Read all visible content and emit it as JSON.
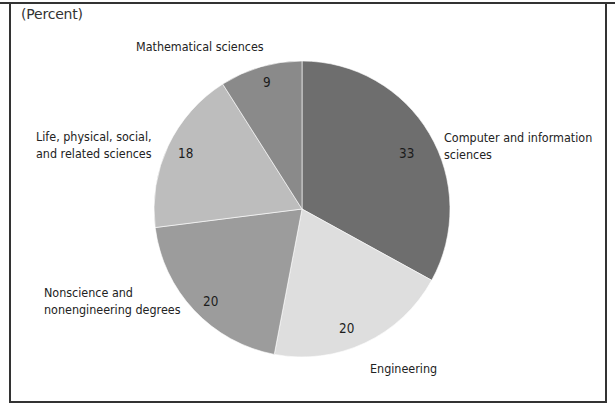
{
  "chart_data": {
    "type": "pie",
    "title": "",
    "unit_label": "(Percent)",
    "start_angle_deg": 0,
    "direction": "clockwise",
    "slices": [
      {
        "label": "Computer and information sciences",
        "label_lines": [
          "Computer and information",
          "sciences"
        ],
        "value": 33,
        "color": "#6e6e6e"
      },
      {
        "label": "Engineering",
        "label_lines": [
          "Engineering"
        ],
        "value": 20,
        "color": "#dedede"
      },
      {
        "label": "Nonscience and nonengineering degrees",
        "label_lines": [
          "Nonscience and",
          "nonengineering degrees"
        ],
        "value": 20,
        "color": "#9c9c9c"
      },
      {
        "label": "Life, physical, social, and related sciences",
        "label_lines": [
          "Life, physical, social,",
          "and related sciences"
        ],
        "value": 18,
        "color": "#bdbdbd"
      },
      {
        "label": "Mathematical sciences",
        "label_lines": [
          "Mathematical sciences"
        ],
        "value": 9,
        "color": "#8a8a8a"
      }
    ],
    "categories": [
      "Computer and information sciences",
      "Engineering",
      "Nonscience and nonengineering degrees",
      "Life, physical, social, and related sciences",
      "Mathematical sciences"
    ],
    "values": [
      33,
      20,
      20,
      18,
      9
    ],
    "legend": "none (direct labels)"
  },
  "labels": {
    "unit": "(Percent)",
    "computer_line1": "Computer and information",
    "computer_line2": "sciences",
    "computer_value": "33",
    "engineering": "Engineering",
    "engineering_value": "20",
    "nonscience_line1": "Nonscience and",
    "nonscience_line2": "nonengineering degrees",
    "nonscience_value": "20",
    "life_line1": "Life, physical, social,",
    "life_line2": "and related sciences",
    "life_value": "18",
    "math": "Mathematical sciences",
    "math_value": "9"
  }
}
